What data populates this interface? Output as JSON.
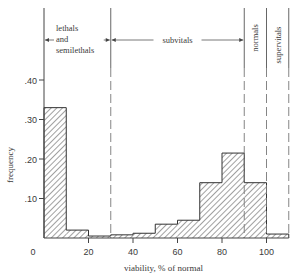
{
  "chart_data": {
    "type": "bar",
    "title": "",
    "xlabel": "viability, % of normal",
    "ylabel": "frequency",
    "xlim": [
      0,
      110
    ],
    "ylim": [
      0,
      0.45
    ],
    "x_ticks": [
      {
        "value": 0,
        "label": "0"
      },
      {
        "value": 20,
        "label": "20"
      },
      {
        "value": 40,
        "label": "40"
      },
      {
        "value": 60,
        "label": "60"
      },
      {
        "value": 80,
        "label": "80"
      },
      {
        "value": 100,
        "label": "100"
      }
    ],
    "y_ticks": [
      {
        "value": 0.1,
        "label": ".10"
      },
      {
        "value": 0.2,
        "label": ".20"
      },
      {
        "value": 0.3,
        "label": ".30"
      },
      {
        "value": 0.4,
        "label": ".40"
      }
    ],
    "bins": [
      {
        "from": 0,
        "to": 10,
        "value": 0.33
      },
      {
        "from": 10,
        "to": 20,
        "value": 0.02
      },
      {
        "from": 20,
        "to": 30,
        "value": 0.005
      },
      {
        "from": 30,
        "to": 40,
        "value": 0.008
      },
      {
        "from": 40,
        "to": 50,
        "value": 0.012
      },
      {
        "from": 50,
        "to": 60,
        "value": 0.035
      },
      {
        "from": 60,
        "to": 70,
        "value": 0.045
      },
      {
        "from": 70,
        "to": 80,
        "value": 0.14
      },
      {
        "from": 80,
        "to": 90,
        "value": 0.215
      },
      {
        "from": 90,
        "to": 100,
        "value": 0.14
      },
      {
        "from": 100,
        "to": 110,
        "value": 0.01
      }
    ],
    "categories": [
      "0-10",
      "10-20",
      "20-30",
      "30-40",
      "40-50",
      "50-60",
      "60-70",
      "70-80",
      "80-90",
      "90-100",
      "100-110"
    ],
    "values": [
      0.33,
      0.02,
      0.005,
      0.008,
      0.012,
      0.035,
      0.045,
      0.14,
      0.215,
      0.14,
      0.01
    ],
    "fill": "diagonal hatch",
    "grid": false,
    "legend": null,
    "regions": [
      {
        "label": "lethals and semilethals",
        "lines": [
          "lethals",
          "and",
          "semilethals"
        ],
        "from": 0,
        "to": 30
      },
      {
        "label": "subvitals",
        "from": 30,
        "to": 90
      },
      {
        "label": "normals",
        "from": 90,
        "to": 100,
        "orientation": "vertical"
      },
      {
        "label": "supervitals",
        "from": 100,
        "to": 110,
        "orientation": "vertical"
      }
    ],
    "divider_lines": [
      30,
      90,
      100,
      110
    ]
  }
}
